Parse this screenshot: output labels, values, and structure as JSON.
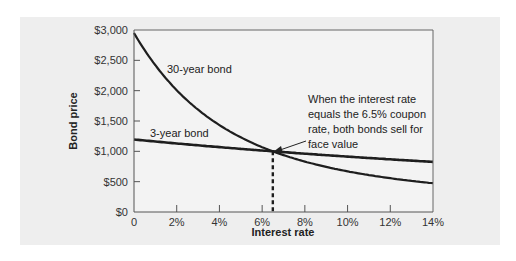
{
  "chart_data": {
    "type": "line",
    "title": "",
    "xlabel": "Interest rate",
    "ylabel": "Bond price",
    "xlim": [
      0,
      14
    ],
    "ylim": [
      0,
      3000
    ],
    "x_ticks": [
      "0",
      "2%",
      "4%",
      "6%",
      "8%",
      "10%",
      "12%",
      "14%"
    ],
    "y_ticks": [
      "$0",
      "$500",
      "$1,000",
      "$1,500",
      "$2,000",
      "$2,500",
      "$3,000"
    ],
    "grid": false,
    "x": [
      0,
      1,
      2,
      3,
      4,
      5,
      6,
      6.5,
      7,
      8,
      9,
      10,
      11,
      12,
      13,
      14
    ],
    "series": [
      {
        "name": "30-year bond",
        "values": [
          2950,
          2500,
          2120,
          1784,
          1432,
          1231,
          1069,
          1000,
          938,
          831,
          744,
          670,
          609,
          557,
          512,
          475
        ]
      },
      {
        "name": "3-year bond",
        "values": [
          1195,
          1131,
          1087,
          1042,
          1069,
          1041,
          1013,
          1000,
          987,
          961,
          937,
          913,
          890,
          868,
          847,
          826
        ]
      }
    ],
    "annotations": [
      {
        "text": "When the interest rate equals the 6.5% coupon rate, both bonds sell for face value",
        "x": 6.5,
        "y": 1000,
        "style": "arrow + dashed vertical line to x-axis"
      }
    ],
    "colors": {
      "panel_bg": "#eeeeee",
      "plot_bg": "#f3f3f3",
      "line": "#1e1e1e",
      "axis": "#555555"
    }
  },
  "labels": {
    "series_30": "30-year bond",
    "series_3": "3-year bond",
    "annotation_lines": [
      "When the interest rate",
      "equals the 6.5% coupon",
      "rate, both bonds sell for",
      "face value"
    ]
  }
}
